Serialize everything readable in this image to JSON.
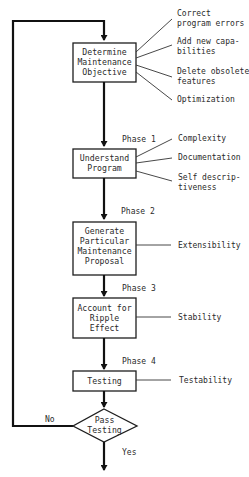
{
  "diagram": {
    "type": "flowchart",
    "steps": [
      {
        "id": "determine",
        "lines": [
          "Determine",
          "Maintenance",
          "Objective"
        ],
        "attributes": [
          {
            "lines": [
              "Correct",
              "program errors"
            ]
          },
          {
            "lines": [
              "Add new capa-",
              "bilities"
            ]
          },
          {
            "lines": [
              "Delete obsolete",
              "features"
            ]
          },
          {
            "lines": [
              "Optimization"
            ]
          }
        ]
      },
      {
        "id": "understand",
        "phase": "Phase 1",
        "lines": [
          "Understand",
          "Program"
        ],
        "attributes": [
          {
            "lines": [
              "Complexity"
            ]
          },
          {
            "lines": [
              "Documentation"
            ]
          },
          {
            "lines": [
              "Self descrip-",
              "tiveness"
            ]
          }
        ]
      },
      {
        "id": "generate",
        "phase": "Phase 2",
        "lines": [
          "Generate",
          "Particular",
          "Maintenance",
          "Proposal"
        ],
        "attributes": [
          {
            "lines": [
              "Extensibility"
            ]
          }
        ]
      },
      {
        "id": "ripple",
        "phase": "Phase 3",
        "lines": [
          "Account for",
          "Ripple",
          "Effect"
        ],
        "attributes": [
          {
            "lines": [
              "Stability"
            ]
          }
        ]
      },
      {
        "id": "testing",
        "phase": "Phase 4",
        "lines": [
          "Testing"
        ],
        "attributes": [
          {
            "lines": [
              "Testability"
            ]
          }
        ]
      }
    ],
    "decision": {
      "lines": [
        "Pass",
        "Testing"
      ],
      "no_label": "No",
      "yes_label": "Yes"
    }
  }
}
